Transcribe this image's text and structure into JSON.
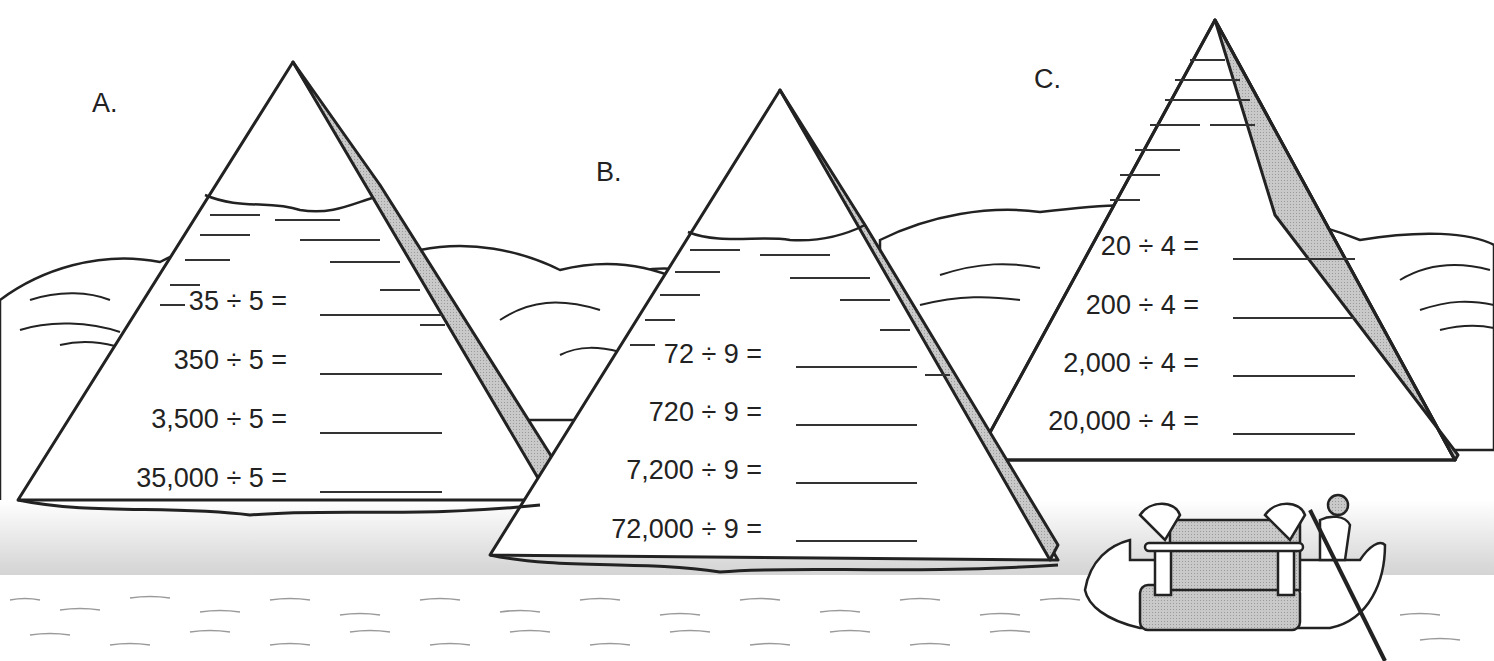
{
  "worksheet": {
    "pyramids": [
      {
        "label": "A.",
        "problems": [
          {
            "expression": "35 ÷ 5 =",
            "answer": ""
          },
          {
            "expression": "350 ÷ 5 =",
            "answer": ""
          },
          {
            "expression": "3,500 ÷ 5 =",
            "answer": ""
          },
          {
            "expression": "35,000 ÷ 5 =",
            "answer": ""
          }
        ]
      },
      {
        "label": "B.",
        "problems": [
          {
            "expression": "72 ÷ 9 =",
            "answer": ""
          },
          {
            "expression": "720 ÷ 9 =",
            "answer": ""
          },
          {
            "expression": "7,200 ÷ 9 =",
            "answer": ""
          },
          {
            "expression": "72,000 ÷ 9 =",
            "answer": ""
          }
        ]
      },
      {
        "label": "C.",
        "problems": [
          {
            "expression": "20 ÷ 4 =",
            "answer": ""
          },
          {
            "expression": "200 ÷ 4 =",
            "answer": ""
          },
          {
            "expression": "2,000 ÷ 4 =",
            "answer": ""
          },
          {
            "expression": "20,000 ÷ 4 =",
            "answer": ""
          }
        ]
      }
    ],
    "illustration": {
      "scene": "Egyptian pyramids with Nile river",
      "boat": "decorated barge with canopy",
      "figure": "boatman with pole"
    }
  }
}
